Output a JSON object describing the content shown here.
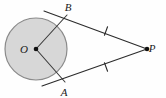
{
  "figure": {
    "background_color": "#fefefe",
    "width": 166,
    "height": 98
  },
  "circle": {
    "name": "circle-O",
    "center_x": 36,
    "center_y": 49,
    "radius": 31,
    "fill_color": "#d7d7d7",
    "stroke_color": "#8a8a8a",
    "stroke_width": 1.2
  },
  "points": {
    "O": {
      "label": "O",
      "x": 36,
      "y": 49,
      "label_x": 24,
      "label_y": 53,
      "dot": true,
      "dot_radius": 2.3,
      "dot_color": "#111111"
    },
    "B": {
      "label": "B",
      "x": 67,
      "y": 15,
      "label_x": 68,
      "label_y": 11,
      "dot": false,
      "dot_radius": 0,
      "dot_color": "#111111"
    },
    "A": {
      "label": "A",
      "x": 65,
      "y": 82,
      "label_x": 64,
      "label_y": 96,
      "dot": false,
      "dot_radius": 0,
      "dot_color": "#111111"
    },
    "P": {
      "label": "P",
      "x": 147,
      "y": 49,
      "label_x": 152,
      "label_y": 52,
      "dot": true,
      "dot_radius": 2.3,
      "dot_color": "#111111"
    }
  },
  "segments": {
    "radius_OB": {
      "name": "radius-O-B",
      "x1": 36,
      "y1": 49,
      "x2": 67,
      "y2": 15,
      "color": "#3a3a3a",
      "width": 1.1
    },
    "radius_OA": {
      "name": "radius-O-A",
      "x1": 36,
      "y1": 49,
      "x2": 65,
      "y2": 82,
      "color": "#3a3a3a",
      "width": 1.1
    },
    "tangent_BP": {
      "name": "tangent-B-P",
      "x1": 44,
      "y1": 11,
      "x2": 147,
      "y2": 49,
      "color": "#2b2b2b",
      "width": 1.1
    },
    "tangent_AP": {
      "name": "tangent-A-P",
      "x1": 42,
      "y1": 86,
      "x2": 147,
      "y2": 49,
      "color": "#2b2b2b",
      "width": 1.1
    }
  },
  "tick_marks": [
    {
      "name": "congruence-tick-upper",
      "segment": "tangent_BP",
      "cx": 106,
      "cy": 31,
      "angle_deg": 20,
      "length": 9,
      "color": "#2b2b2b",
      "width": 1.1
    },
    {
      "name": "congruence-tick-lower",
      "segment": "tangent_AP",
      "cx": 106,
      "cy": 67,
      "angle_deg": -20,
      "length": 9,
      "color": "#2b2b2b",
      "width": 1.1
    }
  ]
}
